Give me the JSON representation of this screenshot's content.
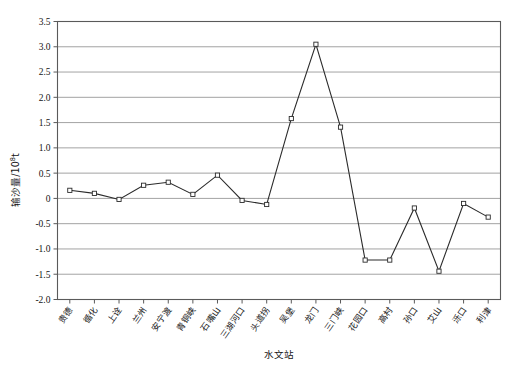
{
  "chart_data": {
    "type": "line",
    "title": "",
    "xlabel": "水文站",
    "ylabel": "输沙量/10⁸t",
    "ylabel_main": "输沙量/10",
    "ylabel_exp": "8",
    "ylabel_unit": "t",
    "ylim": [
      -2.0,
      3.5
    ],
    "ytick_labels": [
      "3.5",
      "3.0",
      "2.5",
      "2.0",
      "1.5",
      "1.0",
      "0.5",
      "0",
      "-0.5",
      "-1.0",
      "-1.5",
      "-2.0"
    ],
    "ytick_values": [
      3.5,
      3.0,
      2.5,
      2.0,
      1.5,
      1.0,
      0.5,
      0,
      -0.5,
      -1.0,
      -1.5,
      -2.0
    ],
    "grid": true,
    "legend": "none",
    "marker": "open-square",
    "line_color": "#2b2b2b",
    "marker_fill": "#ffffff",
    "grid_color": "#8c8c8c",
    "categories": [
      "贵德",
      "循化",
      "上诠",
      "兰州",
      "安宁渡",
      "青铜峡",
      "石嘴山",
      "三湖河口",
      "头道拐",
      "吴堡",
      "龙门",
      "三门峡",
      "花园口",
      "高村",
      "孙口",
      "艾山",
      "泺口",
      "利津"
    ],
    "values": [
      0.16,
      0.1,
      -0.02,
      0.26,
      0.32,
      0.08,
      0.46,
      -0.04,
      -0.12,
      1.58,
      3.05,
      1.41,
      -1.22,
      -1.22,
      -0.19,
      -1.44,
      -0.1,
      -0.37
    ]
  }
}
